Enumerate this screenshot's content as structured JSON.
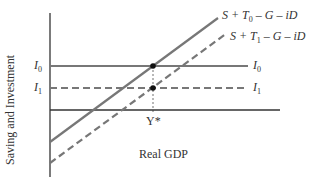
{
  "diagram": {
    "ylabel": "Saving and Investment",
    "xlabel": "Real GDP",
    "equilibrium_label": "Y*",
    "lines": [
      {
        "id": "s_t0",
        "label_parts": [
          "S + T",
          "0",
          " – G – iD"
        ],
        "style": "solid",
        "color": "#777777"
      },
      {
        "id": "s_t1",
        "label_parts": [
          "S + T",
          "1",
          " – G – iD"
        ],
        "style": "dashed",
        "color": "#777777"
      },
      {
        "id": "i0",
        "label_main": "I",
        "label_sub": "0",
        "style": "solid",
        "color": "#777777"
      },
      {
        "id": "i1",
        "label_main": "I",
        "label_sub": "1",
        "style": "dashed",
        "color": "#777777"
      }
    ],
    "left_labels": [
      {
        "main": "I",
        "sub": "0"
      },
      {
        "main": "I",
        "sub": "1"
      }
    ],
    "colors": {
      "axis": "#333333",
      "curve": "#777777",
      "point": "#111111"
    }
  }
}
